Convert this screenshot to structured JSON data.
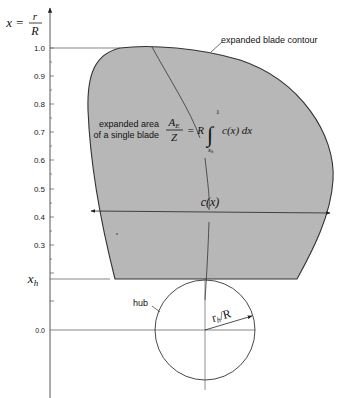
{
  "figure": {
    "type": "propeller expanded blade area diagram",
    "colors": {
      "blade_fill": "#b7b7b7",
      "blade_outline": "#333333",
      "axis": "#444444",
      "text": "#111111",
      "background": "#ffffff"
    }
  },
  "axis": {
    "label_lhs": "x =",
    "label_num": "r",
    "label_den": "R",
    "ticks": [
      {
        "label": "1.0",
        "value": 1.0
      },
      {
        "label": "0.9",
        "value": 0.9
      },
      {
        "label": "0.8",
        "value": 0.8
      },
      {
        "label": "0.7",
        "value": 0.7
      },
      {
        "label": "0.6",
        "value": 0.6
      },
      {
        "label": "0.5",
        "value": 0.5
      },
      {
        "label": "0.4",
        "value": 0.4
      },
      {
        "label": "0.3",
        "value": 0.3
      },
      {
        "label": "0.0",
        "value": 0.0
      }
    ],
    "hub_tick_label_main": "x",
    "hub_tick_label_sub": "h"
  },
  "labels": {
    "contour": "expanded blade contour",
    "area_line1": "expanded area",
    "area_line2": "of a single blade",
    "formula_lhs_num_main": "A",
    "formula_lhs_num_sub": "E",
    "formula_lhs_den": "Z",
    "formula_rhs": "= R",
    "integral_sign": "∫",
    "integral_upper": "1",
    "integral_lower_main": "x",
    "integral_lower_sub": "h",
    "integrand": "c(x) dx",
    "chord": "c(x)",
    "hub": "hub",
    "radius_main": "r",
    "radius_sub": "h",
    "radius_slash": "/R"
  }
}
